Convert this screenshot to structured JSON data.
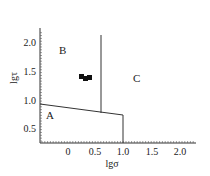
{
  "chart_data": {
    "type": "scatter",
    "title": "",
    "xlabel": "lgσ",
    "ylabel": "lgτ",
    "x_ticks": [
      "0",
      "0.5",
      "1.0",
      "1.5",
      "2.0"
    ],
    "y_ticks": [
      "0.5",
      "1.0",
      "1.5",
      "2.0"
    ],
    "xlim": [
      -0.5,
      2.3
    ],
    "ylim": [
      0.25,
      2.3
    ],
    "grid": false,
    "regions": [
      {
        "label": "A",
        "x": -0.45,
        "y": 0.85
      },
      {
        "label": "B",
        "x": -0.25,
        "y": 1.95
      },
      {
        "label": "C",
        "x": 1.2,
        "y": 1.4
      }
    ],
    "boundaries": [
      {
        "name": "A-B boundary",
        "points": [
          [
            -0.5,
            0.97
          ],
          [
            0.97,
            0.77
          ]
        ]
      },
      {
        "name": "B-C boundary",
        "points": [
          [
            0.58,
            2.15
          ],
          [
            0.58,
            0.8
          ]
        ]
      },
      {
        "name": "A-C boundary",
        "points": [
          [
            0.97,
            0.77
          ],
          [
            0.97,
            0.25
          ]
        ]
      }
    ],
    "series": [
      {
        "name": "data points",
        "marker": "square",
        "points": [
          [
            0.25,
            1.38
          ],
          [
            0.3,
            1.36
          ],
          [
            0.37,
            1.37
          ]
        ]
      }
    ]
  }
}
